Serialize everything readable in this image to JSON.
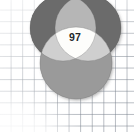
{
  "figure": {
    "kind": "venn-diagram",
    "background": "graph-paper-grid",
    "center_label": "97"
  },
  "chart_data": {
    "type": "venn",
    "title": "",
    "subtitle": "",
    "xlabel": "",
    "ylabel": "",
    "grid": true,
    "legend": "none",
    "sets": [
      {
        "name": "top-left-circle",
        "color": "#6f6f6f",
        "cx": 63,
        "cy": 28,
        "r": 33,
        "label": ""
      },
      {
        "name": "top-right-circle",
        "color": "#6f6f6f",
        "cx": 88,
        "cy": 28,
        "r": 33,
        "label": ""
      },
      {
        "name": "bottom-circle",
        "color": "#9a9a9a",
        "cx": 76,
        "cy": 63,
        "r": 36,
        "label": ""
      }
    ],
    "regions": [
      {
        "name": "triple-intersection",
        "value": 97,
        "label": "97",
        "fill": "#fdfdfb"
      }
    ],
    "annotations": [
      {
        "text": "97",
        "x": 75,
        "y": 37,
        "region": "triple-intersection"
      }
    ]
  },
  "colors": {
    "circle_dark": "#6f6f6f",
    "circle_mid": "#9a9a9a",
    "circle_light": "#c3c3c3",
    "intersection_white": "#fdfdfb",
    "grid_line": "#78808c",
    "page_background": "#ffffff",
    "label_text": "#23272b"
  },
  "geometry": {
    "width": 134,
    "height": 132
  }
}
